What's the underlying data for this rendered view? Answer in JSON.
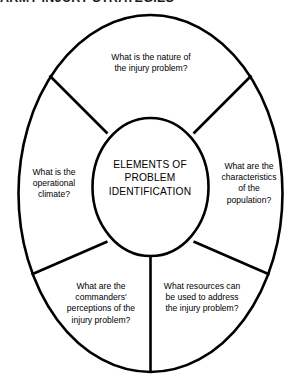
{
  "document": {
    "running_head": "ARMY INJURY STRATEGIES"
  },
  "diagram": {
    "type": "concentric-radial-segments",
    "center": {
      "label": "ELEMENTS OF\nPROBLEM\nIDENTIFICATION"
    },
    "segments": [
      {
        "id": "top",
        "position": "top",
        "label": "What is the nature of\nthe injury problem?"
      },
      {
        "id": "left",
        "position": "left",
        "label": "What is the\noperational\nclimate?"
      },
      {
        "id": "right",
        "position": "right",
        "label": "What are the\ncharacteristics\nof the\npopulation?"
      },
      {
        "id": "bottom-left",
        "position": "bottom-left",
        "label": "What are the\ncommanders'\nperceptions of the\ninjury problem?"
      },
      {
        "id": "bottom-right",
        "position": "bottom-right",
        "label": "What resources can\nbe used to address\nthe injury problem?"
      }
    ],
    "style": {
      "stroke_color": "#000000",
      "fill_color": "#ffffff",
      "background": "#ffffff",
      "text_color": "#000000"
    }
  }
}
